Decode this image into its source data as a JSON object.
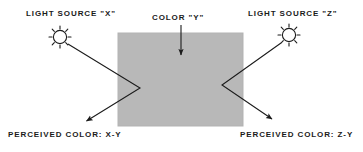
{
  "diagram": {
    "colors": {
      "swatch": "#b8b8b8",
      "swatch_edge": "#b0b0b0",
      "ink": "#1b1b1b",
      "background": "#ffffff"
    },
    "swatch": {
      "name": "color-y-swatch",
      "x": 118,
      "y": 33,
      "width": 125,
      "height": 93
    },
    "labels": {
      "light_source_x": "LIGHT SOURCE \"X\"",
      "color_y": "COLOR \"Y\"",
      "light_source_z": "LIGHT SOURCE \"Z\"",
      "perceived_color_x": "PERCEIVED COLOR: X-Y",
      "perceived_color_z": "PERCEIVED COLOR: Z-Y"
    },
    "icons": {
      "sun_left": "sun-icon",
      "sun_right": "sun-icon",
      "pointer_down": "arrow-down-icon",
      "ray_left": "arrow-ray-icon",
      "ray_right": "arrow-ray-icon"
    },
    "suns": [
      {
        "name": "light-source-x-sun",
        "cx": 60,
        "cy": 37,
        "r": 7,
        "rays": 8
      },
      {
        "name": "light-source-z-sun",
        "cx": 289,
        "cy": 35,
        "r": 7,
        "rays": 8
      }
    ],
    "rays": [
      {
        "name": "ray-x",
        "from": "light-source-x",
        "points": "68,44 140,88 87,120",
        "arrow_tip": "85,122"
      },
      {
        "name": "ray-z",
        "from": "light-source-z",
        "points": "281,43 222,85 271,118",
        "arrow_tip": "274,120"
      }
    ],
    "pointer": {
      "name": "color-y-pointer",
      "x": 181,
      "y_start": 25,
      "y_end": 56
    }
  }
}
